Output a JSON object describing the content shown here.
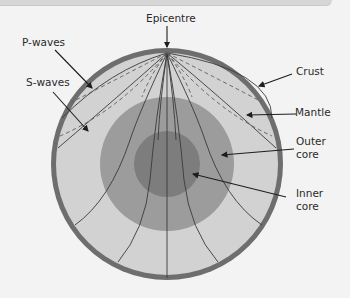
{
  "diagram": {
    "labels": {
      "epicentre": "Epicentre",
      "p_waves": "P-waves",
      "s_waves": "S-waves",
      "crust": "Crust",
      "mantle": "Mantle",
      "outer_core_1": "Outer",
      "outer_core_2": "core",
      "inner_core_1": "Inner",
      "inner_core_2": "core"
    },
    "colors": {
      "background": "#f3f3f3",
      "crust": "#6e6e6e",
      "mantle": "#d2d2d2",
      "outer_core": "#9c9c9c",
      "inner_core": "#7d7d7d",
      "wave_line": "#3a3a3a"
    },
    "layers": [
      "Crust",
      "Mantle",
      "Outer core",
      "Inner core"
    ],
    "wave_types": [
      "P-waves (solid lines)",
      "S-waves (dashed lines)"
    ]
  }
}
